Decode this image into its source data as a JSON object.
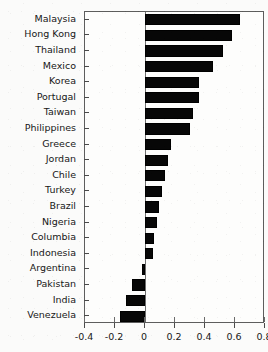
{
  "chart_data": {
    "type": "bar",
    "orientation": "horizontal",
    "title": "",
    "xlabel": "",
    "ylabel": "",
    "xlim": [
      -0.4,
      0.8
    ],
    "xticks": [
      -0.4,
      -0.2,
      0,
      0.2,
      0.4,
      0.6,
      0.8
    ],
    "xtick_labels": [
      "-0.4",
      "-0.2",
      "0",
      "0.2",
      "0.4",
      "0.6",
      "0.8"
    ],
    "grid": false,
    "legend": false,
    "bar_color": "#070707",
    "categories": [
      "Malaysia",
      "Hong Kong",
      "Thailand",
      "Mexico",
      "Korea",
      "Portugal",
      "Taiwan",
      "Philippines",
      "Greece",
      "Jordan",
      "Chile",
      "Turkey",
      "Brazil",
      "Nigeria",
      "Columbia",
      "Indonesia",
      "Argentina",
      "Pakistan",
      "India",
      "Venezuela"
    ],
    "values": [
      0.63,
      0.58,
      0.52,
      0.45,
      0.36,
      0.36,
      0.32,
      0.3,
      0.17,
      0.15,
      0.13,
      0.11,
      0.09,
      0.08,
      0.06,
      0.05,
      -0.02,
      -0.09,
      -0.13,
      -0.17
    ]
  },
  "title_strip": ""
}
